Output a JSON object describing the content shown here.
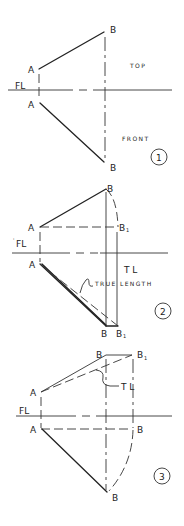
{
  "figure": {
    "panels": [
      {
        "number": "1",
        "fold_line_label": "FL",
        "view_top_label": "TOP",
        "view_front_label": "FRONT",
        "points": {
          "top_a": "A",
          "top_b": "B",
          "front_a": "A",
          "front_b": "B"
        }
      },
      {
        "number": "2",
        "fold_line_label": "FL",
        "fold_line_tick": "'",
        "tl_label": "T L",
        "true_length_label": "TRUE LENGTH",
        "points": {
          "top_a": "A",
          "top_b": "B",
          "top_b1": "B",
          "top_b1_sub": "1",
          "front_a": "A",
          "front_b": "B",
          "front_b1": "B",
          "front_b1_sub": "1"
        }
      },
      {
        "number": "3",
        "fold_line_label": "FL",
        "tl_label": "T L",
        "points": {
          "top_a": "A",
          "top_b": "B",
          "top_b1": "B",
          "top_b1_sub": "1",
          "front_a": "A",
          "front_b_fl": "B",
          "front_b": "B"
        }
      }
    ]
  }
}
